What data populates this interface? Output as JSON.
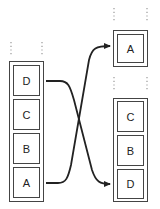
{
  "diagram": {
    "left_stack": {
      "cells": [
        {
          "label": "D"
        },
        {
          "label": "C"
        },
        {
          "label": "B"
        },
        {
          "label": "A"
        }
      ]
    },
    "right_top": {
      "cells": [
        {
          "label": "A"
        }
      ]
    },
    "right_stack": {
      "cells": [
        {
          "label": "C"
        },
        {
          "label": "B"
        },
        {
          "label": "D"
        }
      ]
    },
    "arrows": [
      {
        "from": "D",
        "to": "D",
        "direction": "left-top to right-bottom"
      },
      {
        "from": "A",
        "to": "A",
        "direction": "left-bottom to right-top"
      }
    ],
    "colors": {
      "stroke": "#333333",
      "dots": "#999999"
    }
  }
}
